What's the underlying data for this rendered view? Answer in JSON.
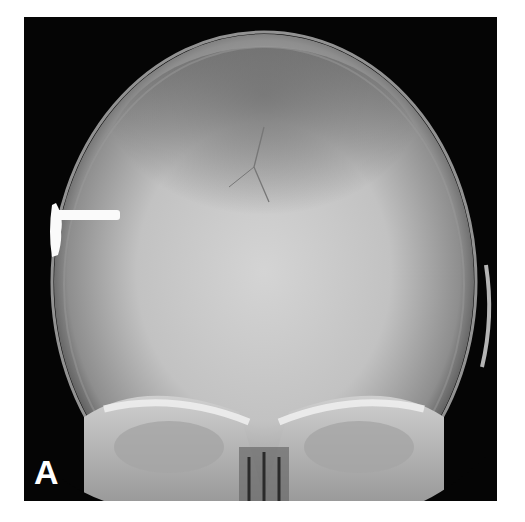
{
  "figure": {
    "panel_label": "A",
    "colors": {
      "background": "#ffffff",
      "film": "#050505",
      "bone": "#e8e8e8",
      "label": "#ffffff"
    }
  }
}
